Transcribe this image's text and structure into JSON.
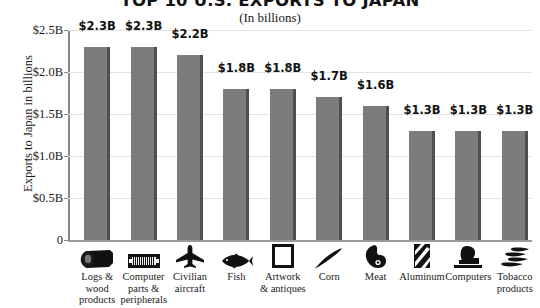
{
  "chart_data": {
    "type": "bar",
    "title": "TOP 10 U.S. EXPORTS TO JAPAN",
    "subtitle": "(In billions)",
    "xlabel": "",
    "ylabel": "Exports to Japan in billions",
    "ylim": [
      0,
      2.5
    ],
    "grid": true,
    "legend": "none",
    "ytick_labels": [
      "$2.5B",
      "$2.0B",
      "$1.5B",
      "$1.0B",
      "$0.5B",
      "0"
    ],
    "ytick_values": [
      2.5,
      2.0,
      1.5,
      1.0,
      0.5,
      0
    ],
    "categories": [
      "Logs &\nwood\nproducts",
      "Computer\nparts &\nperipherals",
      "Civilian\naircraft",
      "Fish",
      "Artwork\n& antiques",
      "Corn",
      "Meat",
      "Aluminum",
      "Computers",
      "Tobacco\nproducts"
    ],
    "values": [
      2.3,
      2.3,
      2.2,
      1.8,
      1.8,
      1.7,
      1.6,
      1.3,
      1.3,
      1.3
    ],
    "value_labels": [
      "$2.3B",
      "$2.3B",
      "$2.2B",
      "$1.8B",
      "$1.8B",
      "$1.7B",
      "$1.6B",
      "$1.3B",
      "$1.3B",
      "$1.3B"
    ],
    "icons": [
      "log-icon",
      "computer-chip-icon",
      "airplane-icon",
      "fish-icon",
      "picture-frame-icon",
      "corn-icon",
      "meat-icon",
      "aluminum-can-icon",
      "computer-monitor-icon",
      "tobacco-leaf-icon"
    ],
    "bar_color": "#7c7c7c",
    "bar_shadow_color": "#4f4f4f",
    "grid_color": "#e2e2e2",
    "axis_color": "#888888",
    "background_color": "#ffffff"
  }
}
